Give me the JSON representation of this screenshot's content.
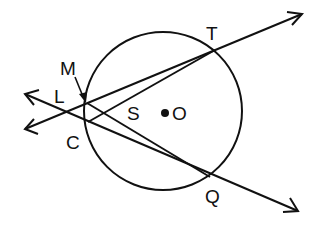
{
  "diagram": {
    "type": "geometry",
    "stroke_color": "#111111",
    "background": "#ffffff",
    "circle": {
      "center_label": "O",
      "cx": 163,
      "cy": 111,
      "r": 79
    },
    "points": [
      {
        "label": "T",
        "x": 215,
        "y": 50,
        "label_x": 206,
        "label_y": 40
      },
      {
        "label": "Q",
        "x": 210,
        "y": 177,
        "label_x": 205,
        "label_y": 203
      },
      {
        "label": "M",
        "x": 87,
        "y": 103,
        "label_x": 60,
        "label_y": 68
      },
      {
        "label": "L",
        "x": 64,
        "y": 112,
        "label_x": 54,
        "label_y": 103
      },
      {
        "label": "C",
        "x": 88,
        "y": 122,
        "label_x": 66,
        "label_y": 149
      },
      {
        "label": "S",
        "x": 107,
        "y": 113,
        "label_x": 127,
        "label_y": 120
      },
      {
        "label": "O",
        "x": 165,
        "y": 113,
        "label_x": 172,
        "label_y": 120
      }
    ],
    "labels": {
      "T": "T",
      "Q": "Q",
      "M": "M",
      "L": "L",
      "C": "C",
      "S": "S",
      "O": "O"
    },
    "rays": [
      {
        "name": "ray-through-M-T",
        "from": [
          25,
          129
        ],
        "to": [
          302,
          14
        ],
        "arrow_both": true
      },
      {
        "name": "ray-through-C-Q",
        "from": [
          25,
          94
        ],
        "to": [
          298,
          211
        ],
        "arrow_both": true
      }
    ],
    "segments": [
      {
        "name": "segment-C-T",
        "from": [
          88,
          122
        ],
        "to": [
          215,
          50
        ]
      },
      {
        "name": "segment-M-Q",
        "from": [
          87,
          103
        ],
        "to": [
          210,
          177
        ]
      }
    ],
    "pointer_arrow": {
      "from_label": "M",
      "to": [
        85,
        101
      ]
    }
  }
}
